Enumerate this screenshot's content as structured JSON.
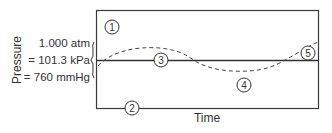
{
  "diagram": {
    "type": "pressure-vs-time",
    "axes": {
      "ylabel": "Pressure",
      "xlabel": "Time"
    },
    "reference_pressure": {
      "lines": [
        "1.000 atm",
        "= 101.3 kPa",
        "= 760 mmHg"
      ]
    },
    "markers": [
      {
        "id": "1",
        "label": "1"
      },
      {
        "id": "2",
        "label": "2"
      },
      {
        "id": "3",
        "label": "3"
      },
      {
        "id": "4",
        "label": "4"
      },
      {
        "id": "5",
        "label": "5"
      }
    ],
    "series": [
      {
        "name": "atmospheric-reference",
        "style": "solid"
      },
      {
        "name": "pressure-fluctuation",
        "style": "dashed"
      }
    ],
    "colors": {
      "stroke": "#3a3a3a",
      "text": "#333333",
      "background": "#ffffff"
    }
  }
}
